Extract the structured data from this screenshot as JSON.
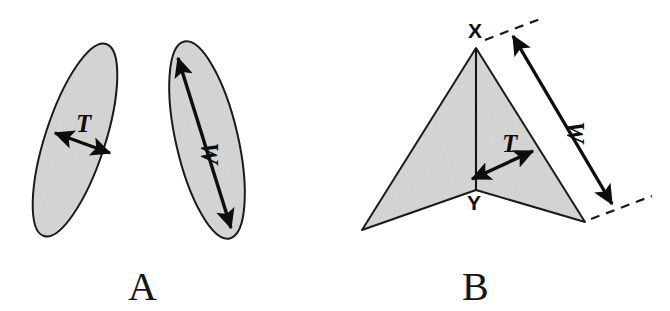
{
  "figure": {
    "background_color": "#ffffff",
    "ink_color": "#0d0d0d",
    "fill_color": "#d5d5d5",
    "width": 670,
    "height": 311
  },
  "panels": [
    {
      "id": "A",
      "letter": "A",
      "letter_x": 128,
      "letter_y": 300,
      "description": "Two shaded lens/ellipse shapes in oblique view",
      "shapes": [
        {
          "name": "left-ellipse",
          "cx": 75,
          "cy": 140,
          "rx": 30,
          "ry": 101,
          "rotation": 18
        },
        {
          "name": "right-ellipse",
          "cx": 207,
          "cy": 140,
          "rx": 31,
          "ry": 101,
          "rotation": -13
        }
      ],
      "measures": [
        {
          "name": "thickness-arrow",
          "label": "T",
          "label_x": 76,
          "label_y": 132,
          "x1": 55,
          "y1": 133,
          "x2": 110,
          "y2": 153,
          "double_headed": true,
          "label_rotation": 0
        },
        {
          "name": "width-arrow",
          "label": "W",
          "label_x": 201,
          "label_y": 142,
          "x1": 178,
          "y1": 58,
          "x2": 231,
          "y2": 228,
          "double_headed": true,
          "label_rotation": 90
        }
      ]
    },
    {
      "id": "B",
      "letter": "B",
      "letter_x": 462,
      "letter_y": 300,
      "description": "Shaded arrowhead outline with apex X, notch vertex Y, and W / T dimension arrows",
      "vertices": [
        {
          "name": "apex",
          "label": "X",
          "x": 476,
          "y": 48,
          "label_x": 468,
          "label_y": 38
        },
        {
          "name": "left-barb",
          "label": "",
          "x": 362,
          "y": 230,
          "label_x": 0,
          "label_y": 0
        },
        {
          "name": "notch",
          "label": "Y",
          "x": 476,
          "y": 190,
          "label_x": 467,
          "label_y": 210
        },
        {
          "name": "right-barb",
          "label": "",
          "x": 585,
          "y": 222,
          "label_x": 0,
          "label_y": 0
        }
      ],
      "measures": [
        {
          "name": "width-arrow",
          "label": "W",
          "label_x": 567,
          "label_y": 121,
          "x1": 513,
          "y1": 36,
          "x2": 612,
          "y2": 204,
          "double_headed": true,
          "label_rotation": 90
        },
        {
          "name": "thickness-arrow",
          "label": "T",
          "label_x": 502,
          "label_y": 152,
          "x1": 533,
          "y1": 151,
          "x2": 472,
          "y2": 179,
          "double_headed": true,
          "label_rotation": 0
        }
      ],
      "guides": [
        {
          "name": "upper-dashed-guide",
          "x1": 485,
          "y1": 40,
          "x2": 540,
          "y2": 19
        },
        {
          "name": "lower-dashed-guide",
          "x1": 591,
          "y1": 219,
          "x2": 652,
          "y2": 196
        }
      ],
      "midline": {
        "name": "apex-to-notch-line",
        "x1": 476,
        "y1": 48,
        "x2": 476,
        "y2": 190
      }
    }
  ]
}
